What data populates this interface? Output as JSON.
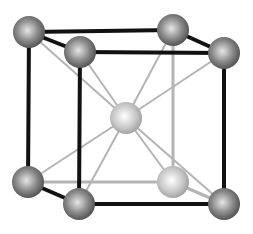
{
  "diagram": {
    "structure": "body-centered cubic",
    "atom_count_visible": 9,
    "atoms": [
      {
        "id": "back-top-left",
        "kind": "corner",
        "shade": "dark",
        "pos": [
          0,
          1,
          1
        ]
      },
      {
        "id": "back-top-right",
        "kind": "corner",
        "shade": "dark",
        "pos": [
          1,
          1,
          1
        ]
      },
      {
        "id": "front-top-left",
        "kind": "corner",
        "shade": "dark",
        "pos": [
          0,
          1,
          0
        ]
      },
      {
        "id": "front-top-right",
        "kind": "corner",
        "shade": "dark",
        "pos": [
          1,
          1,
          0
        ]
      },
      {
        "id": "back-bottom-left",
        "kind": "corner",
        "shade": "dark",
        "pos": [
          0,
          0,
          1
        ]
      },
      {
        "id": "back-bottom-right",
        "kind": "corner-hidden",
        "shade": "light",
        "pos": [
          1,
          0,
          1
        ]
      },
      {
        "id": "front-bottom-left",
        "kind": "corner",
        "shade": "dark",
        "pos": [
          0,
          0,
          0
        ]
      },
      {
        "id": "front-bottom-right",
        "kind": "corner",
        "shade": "dark",
        "pos": [
          1,
          0,
          0
        ]
      },
      {
        "id": "body-center",
        "kind": "center",
        "shade": "light",
        "pos": [
          0.5,
          0.5,
          0.5
        ]
      }
    ],
    "colors": {
      "edge_visible": "#111111",
      "edge_hidden": "#b4b4b4",
      "diagonal": "#b4b4b4",
      "atom_dark_highlight": "#e6e6e6",
      "atom_dark_shadow": "#4a4a4a",
      "atom_light_highlight": "#ffffff",
      "atom_light_shadow": "#9a9a9a"
    }
  }
}
